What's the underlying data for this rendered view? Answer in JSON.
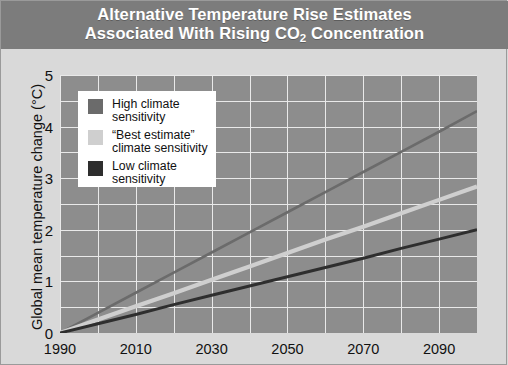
{
  "title": {
    "line1": "Alternative Temperature Rise Estimates",
    "line2_pre": "Associated With Rising CO",
    "line2_sub": "2",
    "line2_post": " Concentration",
    "full": "Alternative Temperature Rise Estimates Associated With Rising CO2 Concentration"
  },
  "colors": {
    "title_band": "#7c7c7c",
    "figure_background": "#d9d9d9",
    "plot_background": "#8d8d8d",
    "gridline": "#e9e9e9",
    "legend_background": "#ffffff",
    "high_sensitivity": "#6b6b6b",
    "best_estimate": "#cfcfcf",
    "low_sensitivity": "#2e2e2e",
    "text": "#111111",
    "title_text": "#ffffff"
  },
  "axes": {
    "ylabel": "Global mean temperature change (°C)",
    "xlabel": "",
    "yticks": [
      "0",
      "1",
      "2",
      "3",
      "4",
      "5"
    ],
    "ytick_values": [
      0,
      1,
      2,
      3,
      4,
      5
    ],
    "ylim": [
      0,
      5
    ],
    "xticks": [
      "1990",
      "2010",
      "2030",
      "2050",
      "2070",
      "2090"
    ],
    "xtick_values": [
      1990,
      2010,
      2030,
      2050,
      2070,
      2090
    ],
    "xlim": [
      1990,
      2100
    ],
    "minor_y_step": 0.5,
    "minor_x_step": 10,
    "grid": true
  },
  "legend": {
    "position": "inside-upper-left",
    "items": [
      {
        "label": "High climate\nsensitivity",
        "color": "#6b6b6b",
        "series": "high"
      },
      {
        "label": "“Best estimate”\nclimate sensitivity",
        "color": "#cfcfcf",
        "series": "best"
      },
      {
        "label": "Low climate\nsensitivity",
        "color": "#2e2e2e",
        "series": "low"
      }
    ]
  },
  "chart_data": {
    "type": "line",
    "title": "Alternative Temperature Rise Estimates Associated With Rising CO2 Concentration",
    "xlabel": "",
    "ylabel": "Global mean temperature change (°C)",
    "xlim": [
      1990,
      2100
    ],
    "ylim": [
      0,
      5
    ],
    "grid": true,
    "legend_position": "inside-upper-left",
    "x": [
      1990,
      2000,
      2010,
      2020,
      2030,
      2040,
      2050,
      2060,
      2070,
      2080,
      2090,
      2100
    ],
    "series": [
      {
        "name": "High climate sensitivity",
        "color": "#6b6b6b",
        "values": [
          0.0,
          0.39,
          0.78,
          1.17,
          1.56,
          1.95,
          2.34,
          2.73,
          3.12,
          3.51,
          3.9,
          4.3
        ]
      },
      {
        "name": "“Best estimate” climate sensitivity",
        "color": "#cfcfcf",
        "values": [
          0.0,
          0.26,
          0.52,
          0.77,
          1.03,
          1.29,
          1.55,
          1.81,
          2.06,
          2.32,
          2.58,
          2.84
        ]
      },
      {
        "name": "Low climate sensitivity",
        "color": "#2e2e2e",
        "values": [
          0.0,
          0.18,
          0.36,
          0.55,
          0.73,
          0.91,
          1.09,
          1.27,
          1.45,
          1.64,
          1.82,
          2.0
        ]
      }
    ]
  }
}
